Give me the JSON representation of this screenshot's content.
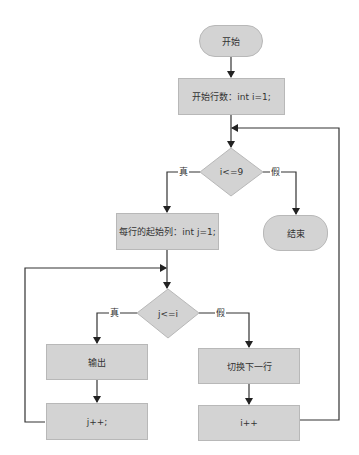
{
  "flowchart": {
    "nodes": {
      "start": {
        "label": "开始",
        "shape": "terminal"
      },
      "init_row": {
        "label": "开始行数：int i=1;",
        "shape": "process"
      },
      "cond_row": {
        "label": "i<=9",
        "shape": "decision"
      },
      "init_col": {
        "label": "每行的起始列：int j=1;",
        "shape": "process"
      },
      "end": {
        "label": "结束",
        "shape": "terminal"
      },
      "cond_col": {
        "label": "j<=i",
        "shape": "decision"
      },
      "output": {
        "label": "输出",
        "shape": "process"
      },
      "next_row": {
        "label": "切换下一行",
        "shape": "process"
      },
      "inc_j": {
        "label": "j++;",
        "shape": "process"
      },
      "inc_i": {
        "label": "i++",
        "shape": "process"
      }
    },
    "edge_labels": {
      "row_true": "真",
      "row_false": "假",
      "col_true": "真",
      "col_false": "假"
    },
    "colors": {
      "node_fill": "#d3d3d3",
      "node_border": "#b8b8b8",
      "edge": "#333333"
    }
  }
}
